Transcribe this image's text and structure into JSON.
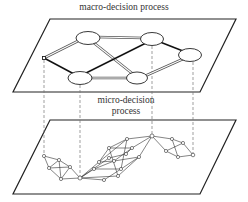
{
  "labels": {
    "macro": "macro-decision process",
    "micro_line1": "micro-decision",
    "micro_line2": "process"
  },
  "colors": {
    "plane_stroke": "#222222",
    "edge_dark": "#111111",
    "edge_light": "#555555",
    "dash": "#777777",
    "node_fill": "#ffffff"
  },
  "macro_network": {
    "nodes": [
      {
        "id": "s",
        "x": 44,
        "y": 58,
        "type": "small"
      },
      {
        "id": "A",
        "x": 88,
        "y": 38,
        "type": "ellipse"
      },
      {
        "id": "B",
        "x": 152,
        "y": 39,
        "type": "ellipse"
      },
      {
        "id": "C",
        "x": 190,
        "y": 55,
        "type": "ellipse"
      },
      {
        "id": "D",
        "x": 80,
        "y": 78,
        "type": "ellipse"
      },
      {
        "id": "E",
        "x": 137,
        "y": 78,
        "type": "ellipse"
      }
    ],
    "edges": [
      {
        "from": "s",
        "to": "A",
        "style": "double"
      },
      {
        "from": "s",
        "to": "D",
        "style": "bold"
      },
      {
        "from": "A",
        "to": "B",
        "style": "double"
      },
      {
        "from": "A",
        "to": "E",
        "style": "double"
      },
      {
        "from": "D",
        "to": "B",
        "style": "bold"
      },
      {
        "from": "D",
        "to": "E",
        "style": "double"
      },
      {
        "from": "B",
        "to": "C",
        "style": "bold"
      },
      {
        "from": "E",
        "to": "C",
        "style": "double"
      }
    ]
  },
  "micro_network": {
    "key_nodes": [
      "s",
      "D",
      "B",
      "C"
    ]
  }
}
